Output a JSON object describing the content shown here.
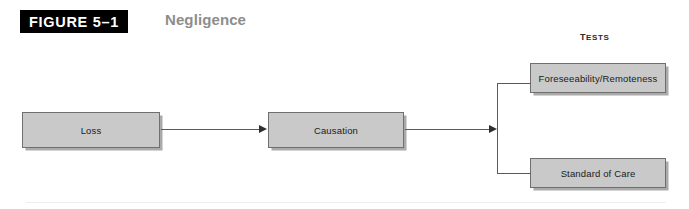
{
  "figure": {
    "badge_label": "FIGURE 5–1",
    "title": "Negligence"
  },
  "group_label": "Tests",
  "nodes": [
    {
      "id": "loss",
      "label": "Loss"
    },
    {
      "id": "causation",
      "label": "Causation"
    },
    {
      "id": "foreseeability",
      "label": "Foreseeability/Remoteness"
    },
    {
      "id": "standard-of-care",
      "label": "Standard of Care"
    }
  ],
  "connectors": [
    {
      "id": "loss-to-causation",
      "from": "loss",
      "to": "causation",
      "kind": "arrow"
    },
    {
      "id": "causation-to-tests",
      "from": "causation",
      "to": "tests-bracket",
      "kind": "arrow"
    },
    {
      "id": "bracket-to-foreseeability",
      "from": "tests-bracket",
      "to": "foreseeability",
      "kind": "line"
    },
    {
      "id": "bracket-to-standard",
      "from": "tests-bracket",
      "to": "standard-of-care",
      "kind": "line"
    }
  ],
  "colors": {
    "badge_background": "#000000",
    "badge_text": "#ffffff",
    "title_text": "#8d8d8d",
    "node_fill": "#c9c9c9",
    "node_border": "#6f6f6f",
    "connector": "#5a5a5a",
    "page_background": "#ffffff"
  }
}
